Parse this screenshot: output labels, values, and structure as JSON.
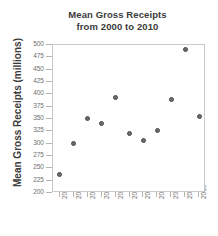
{
  "chart_data": {
    "type": "scatter",
    "title": "Mean Gross Receipts from 2000 to 2010",
    "title_line1": "Mean Gross Receipts",
    "title_line2": "from 2000 to 2010",
    "xlabel": "",
    "ylabel": "Mean Gross Receipts (millions)",
    "categories": [
      "2000",
      "2001",
      "2002",
      "2003",
      "2004",
      "2005",
      "2006",
      "2007",
      "2008",
      "2009",
      "2010"
    ],
    "x": [
      2000,
      2001,
      2002,
      2003,
      2004,
      2005,
      2006,
      2007,
      2008,
      2009,
      2010
    ],
    "values": [
      237,
      300,
      352,
      341,
      394,
      320,
      307,
      326,
      390,
      490,
      355
    ],
    "ylim": [
      200,
      500
    ],
    "yticks": [
      200,
      225,
      250,
      275,
      300,
      325,
      350,
      375,
      400,
      425,
      450,
      475,
      500
    ],
    "ytick_labels": [
      "200",
      "225",
      "250",
      "275",
      "300",
      "325",
      "350",
      "375",
      "400",
      "425",
      "450",
      "475",
      "500"
    ],
    "xtick_labels": [
      "2000",
      "2001",
      "2002",
      "2003",
      "2004",
      "2005",
      "2006",
      "2007",
      "2008",
      "2009",
      "2010"
    ],
    "grid": false,
    "legend": null,
    "marker_color": "#6b6b6b",
    "frame_color": "#c9c9c9",
    "text_color": "#3b3b3b",
    "tick_text_color": "#6e6e6e"
  }
}
